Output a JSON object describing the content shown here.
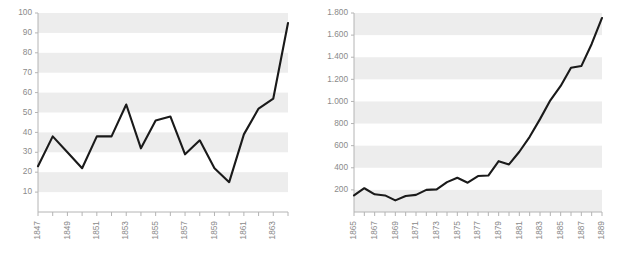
{
  "figure": {
    "name": "two-line-charts",
    "panels": [
      "left",
      "right"
    ]
  },
  "chart_data": [
    {
      "type": "line",
      "panel": "left",
      "title": "",
      "xlabel": "",
      "ylabel": "",
      "grid": "horizontal-alternating-bands",
      "legend": "none",
      "xlim": [
        1847,
        1864
      ],
      "ylim": [
        0,
        100
      ],
      "ytick_labels": [
        "100",
        "90",
        "80",
        "70",
        "60",
        "50",
        "40",
        "30",
        "20",
        "10"
      ],
      "ytick_values": [
        100,
        90,
        80,
        70,
        60,
        50,
        40,
        30,
        20,
        10
      ],
      "xtick_labels": [
        "1847",
        "1849",
        "1851",
        "1853",
        "1855",
        "1857",
        "1859",
        "1861",
        "1863"
      ],
      "xtick_values": [
        1847,
        1849,
        1851,
        1853,
        1855,
        1857,
        1859,
        1861,
        1863
      ],
      "x": [
        1847,
        1848,
        1849,
        1850,
        1851,
        1852,
        1853,
        1854,
        1855,
        1856,
        1857,
        1858,
        1859,
        1860,
        1861,
        1862,
        1863,
        1864
      ],
      "values": [
        23,
        38,
        30,
        22,
        38,
        38,
        54,
        32,
        46,
        48,
        29,
        36,
        22,
        15,
        39,
        52,
        57,
        95
      ],
      "series": [
        {
          "name": "series-1",
          "color": "#1a1a1a",
          "values": [
            23,
            38,
            30,
            22,
            38,
            38,
            54,
            32,
            46,
            48,
            29,
            36,
            22,
            15,
            39,
            52,
            57,
            95
          ]
        }
      ]
    },
    {
      "type": "line",
      "panel": "right",
      "title": "",
      "xlabel": "",
      "ylabel": "",
      "grid": "horizontal-alternating-bands",
      "legend": "none",
      "xlim": [
        1865,
        1889
      ],
      "ylim": [
        0,
        1800
      ],
      "ytick_labels": [
        "1.800",
        "1.600",
        "1.400",
        "1.200",
        "1.000",
        "800",
        "600",
        "400",
        "200"
      ],
      "ytick_values": [
        1800,
        1600,
        1400,
        1200,
        1000,
        800,
        600,
        400,
        200
      ],
      "xtick_labels": [
        "1865",
        "1867",
        "1869",
        "1871",
        "1873",
        "1875",
        "1877",
        "1879",
        "1881",
        "1883",
        "1885",
        "1887",
        "1889"
      ],
      "xtick_values": [
        1865,
        1867,
        1869,
        1871,
        1873,
        1875,
        1877,
        1879,
        1881,
        1883,
        1885,
        1887,
        1889
      ],
      "x": [
        1865,
        1866,
        1867,
        1868,
        1869,
        1870,
        1871,
        1872,
        1873,
        1874,
        1875,
        1876,
        1877,
        1878,
        1879,
        1880,
        1881,
        1882,
        1883,
        1884,
        1885,
        1886,
        1887,
        1888,
        1889
      ],
      "values": [
        150,
        215,
        160,
        150,
        105,
        145,
        155,
        200,
        205,
        270,
        310,
        265,
        325,
        330,
        460,
        430,
        545,
        680,
        840,
        1010,
        1140,
        1305,
        1320,
        1520,
        1755
      ],
      "series": [
        {
          "name": "series-1",
          "color": "#1a1a1a",
          "values": [
            150,
            215,
            160,
            150,
            105,
            145,
            155,
            200,
            205,
            270,
            310,
            265,
            325,
            330,
            460,
            430,
            545,
            680,
            840,
            1010,
            1140,
            1305,
            1320,
            1520,
            1755
          ]
        }
      ]
    }
  ],
  "style": {
    "band_color": "#ededed",
    "axis_color": "#b4b4b4",
    "line_color": "#1a1a1a",
    "label_color": "#8a8a8a",
    "background": "#ffffff"
  }
}
